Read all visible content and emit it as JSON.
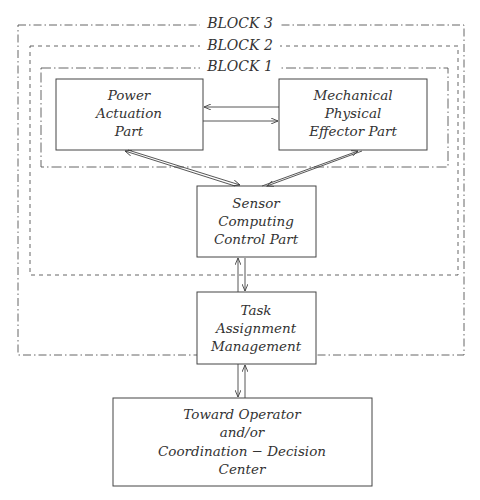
{
  "blocks": [
    {
      "id": "block3",
      "label": "BLOCK 3"
    },
    {
      "id": "block2",
      "label": "BLOCK 2"
    },
    {
      "id": "block1",
      "label": "BLOCK 1"
    }
  ],
  "boxes": {
    "power": {
      "lines": [
        "Power",
        "Actuation",
        "Part"
      ]
    },
    "mechanical": {
      "lines": [
        "Mechanical",
        "Physical",
        "Effector Part"
      ]
    },
    "sensor": {
      "lines": [
        "Sensor",
        "Computing",
        "Control Part"
      ]
    },
    "task": {
      "lines": [
        "Task",
        "Assignment",
        "Management"
      ]
    },
    "operator": {
      "lines": [
        "Toward Operator",
        "and/or",
        "Coordination − Decision",
        "Center"
      ]
    }
  },
  "colors": {
    "line": "#444444",
    "text": "#333333",
    "background": "#ffffff"
  }
}
